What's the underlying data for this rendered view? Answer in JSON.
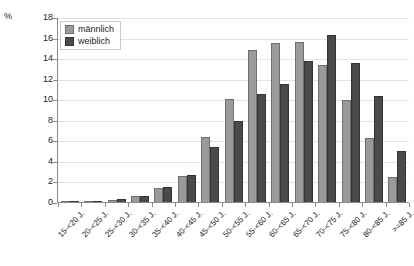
{
  "chart_data": {
    "type": "bar",
    "title": "",
    "xlabel": "",
    "ylabel": "%",
    "ylim": [
      0,
      18
    ],
    "ytick_step": 2,
    "yticks": [
      18,
      16,
      14,
      12,
      10,
      8,
      6,
      4,
      2,
      0
    ],
    "grid": true,
    "legend_position": "top-left",
    "categories": [
      "15-<20 J.",
      "20-<25 J.",
      "25-<30 J.",
      "30-<35 J.",
      "35-<40 J.",
      "40-<45 J.",
      "45-<50 J.",
      "50-<55 J.",
      "55-<60 J.",
      "60-<65 J.",
      "65-<70 J.",
      "70-<75 J.",
      "75-<80 J.",
      "80-<85 J.",
      ">=85 J."
    ],
    "series": [
      {
        "name": "männlich",
        "color": "#9a9a9a",
        "values": [
          0.1,
          0.1,
          0.2,
          0.6,
          1.4,
          2.5,
          6.4,
          10.1,
          14.9,
          15.6,
          15.7,
          13.4,
          10.0,
          6.3,
          2.4
        ]
      },
      {
        "name": "weiblich",
        "color": "#4a4a4a",
        "values": [
          0.1,
          0.1,
          0.3,
          0.6,
          1.5,
          2.6,
          5.4,
          7.9,
          10.6,
          11.5,
          13.8,
          16.3,
          13.6,
          10.4,
          5.0
        ]
      }
    ]
  },
  "legend": {
    "items": [
      {
        "label": "männlich"
      },
      {
        "label": "weiblich"
      }
    ]
  },
  "axes": {
    "y_unit": "%"
  },
  "colors": {
    "series_male": "#9a9a9a",
    "series_female": "#4a4a4a",
    "gridline": "#e2e2e2",
    "axis": "#8a8a8a",
    "text": "#222222"
  }
}
